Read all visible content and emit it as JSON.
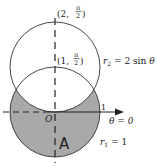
{
  "diagram": {
    "point_top": {
      "r": "2",
      "theta_num": "π",
      "theta_den": "2",
      "open": "(2, ",
      "close": ")"
    },
    "point_mid": {
      "r": "1",
      "theta_num": "π",
      "theta_den": "2",
      "open": "(1, ",
      "close": ")"
    },
    "origin_label": "O",
    "tick_label": "1",
    "axis_label": "θ = 0",
    "region_label": "A",
    "curve2": {
      "name": "r",
      "sub": "2",
      "eq": " = 2 sin ",
      "var": "θ"
    },
    "curve1": {
      "name": "r",
      "sub": "1",
      "eq": " = 1"
    },
    "colors": {
      "shade": "#a9a9a9",
      "stroke": "#333333"
    }
  }
}
